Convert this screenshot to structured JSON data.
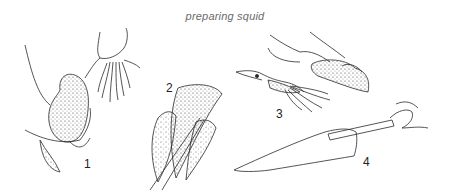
{
  "caption": "preparing squid",
  "steps": [
    {
      "label": "1",
      "description": "hold body, pull head and tentacles away"
    },
    {
      "label": "2",
      "description": "remove quill"
    },
    {
      "label": "3",
      "description": "peel off skin"
    },
    {
      "label": "4",
      "description": "scrape / clean body tube"
    }
  ],
  "colors": {
    "ink": "#2a2a2a",
    "caption": "#6a6a6a",
    "background": "#ffffff"
  }
}
